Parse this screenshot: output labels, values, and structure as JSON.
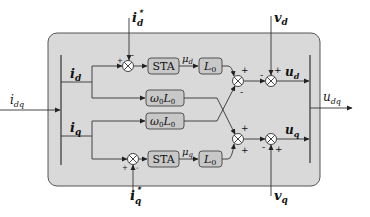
{
  "diagram": {
    "type": "control-block-diagram",
    "colors": {
      "background": "#ffffff",
      "panel": "#d9d9d9",
      "block": "#c8c8c8",
      "stroke": "#333333",
      "junction_fill": "#ffffff"
    },
    "inputs": {
      "i_dq": "i",
      "i_dq_sub": "dq",
      "i_d_ref": "i",
      "i_d_ref_sub": "d",
      "i_d_ref_sup": "⋆",
      "i_q_ref": "i",
      "i_q_ref_sub": "q",
      "i_q_ref_sup": "⋆",
      "v_d": "v",
      "v_d_sub": "d",
      "v_q": "v",
      "v_q_sub": "q"
    },
    "signals": {
      "i_d": "i",
      "i_d_sub": "d",
      "i_q": "i",
      "i_q_sub": "q",
      "mu_d": "μ",
      "mu_d_sub": "d",
      "mu_q": "μ",
      "mu_q_sub": "q",
      "u_d": "u",
      "u_d_sub": "d",
      "u_q": "u",
      "u_q_sub": "q"
    },
    "outputs": {
      "u_dq": "u",
      "u_dq_sub": "dq"
    },
    "blocks": {
      "sta_d": "STA",
      "sta_q": "STA",
      "l0_d": "L",
      "l0_d_sub": "0",
      "l0_q": "L",
      "l0_q_sub": "0",
      "w0l0_top": "ω",
      "w0l0_top_rest": "L",
      "w0l0_bottom": "ω",
      "w0l0_bottom_rest": "L",
      "sub0": "0"
    },
    "signs": {
      "plus": "+",
      "minus": "-"
    }
  }
}
